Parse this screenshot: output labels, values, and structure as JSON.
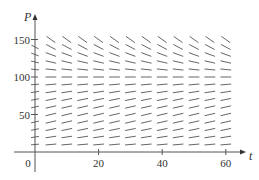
{
  "chart_data": {
    "type": "direction-field",
    "title": "",
    "xlabel": "t",
    "ylabel": "P",
    "xlim": [
      0,
      65
    ],
    "ylim": [
      0,
      165
    ],
    "grid": false,
    "legend": null,
    "x_ticks": [
      {
        "value": 0,
        "label": "0"
      },
      {
        "value": 20,
        "label": "20"
      },
      {
        "value": 40,
        "label": "40"
      },
      {
        "value": 60,
        "label": "60"
      }
    ],
    "y_ticks": [
      {
        "value": 50,
        "label": "50"
      },
      {
        "value": 100,
        "label": "100"
      },
      {
        "value": 150,
        "label": "150"
      }
    ],
    "y_minor_ticks": [
      10,
      20,
      30,
      40,
      60,
      70,
      80,
      90,
      110,
      120,
      130,
      140
    ],
    "field": {
      "description": "Direction field of a logistic equation dP/dt = kP(1 - P/M), equilibrium near P = 100",
      "k": 0.04,
      "M": 100,
      "t_values": [
        5,
        10,
        15,
        20,
        25,
        30,
        35,
        40,
        45,
        50,
        55,
        60
      ],
      "P_values": [
        10,
        20,
        30,
        40,
        50,
        60,
        70,
        80,
        90,
        100,
        110,
        120,
        130,
        140,
        150
      ],
      "segment_length_px": 10
    },
    "colors": {
      "axis": "#555555",
      "segment": "#555555",
      "text": "#333333"
    }
  },
  "layout": {
    "origin_px": [
      35,
      152
    ],
    "px_per_t": 3.18,
    "px_per_P": 0.75,
    "x_axis_end_px": 246,
    "y_axis_top_px": 14
  }
}
